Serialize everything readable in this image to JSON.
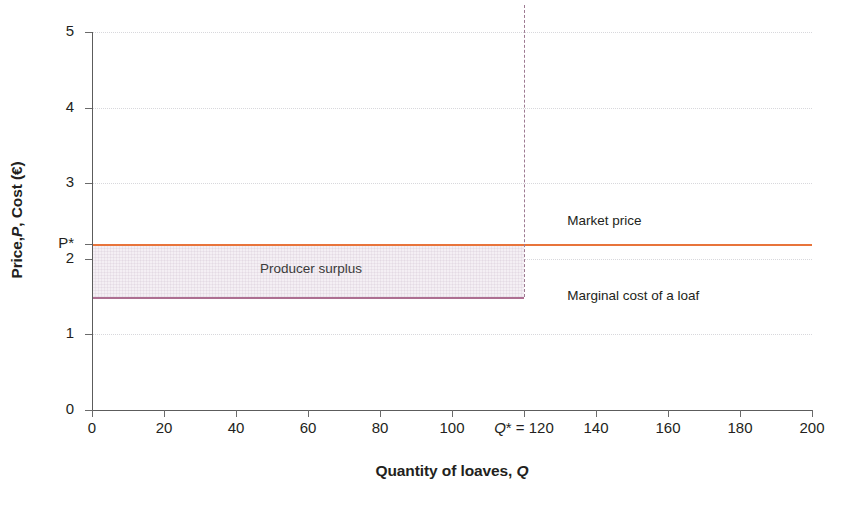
{
  "chart_data": {
    "type": "line",
    "title": "",
    "xlabel": "Quantity of loaves, Q",
    "ylabel": "Price, P, Cost (€)",
    "xlim": [
      0,
      200
    ],
    "ylim": [
      0,
      5
    ],
    "grid": true,
    "legend_position": "inline-right",
    "xticks": [
      0,
      20,
      40,
      60,
      80,
      100,
      120,
      140,
      160,
      180,
      200
    ],
    "xticklabels": [
      "0",
      "20",
      "40",
      "60",
      "80",
      "100",
      "Q* = 120",
      "140",
      "160",
      "180",
      "200"
    ],
    "yticks": [
      0,
      1,
      2,
      3,
      4,
      5
    ],
    "yticklabels": [
      "0",
      "1",
      "2",
      "3",
      "4",
      "5"
    ],
    "extra_ytick": {
      "value": 2.2,
      "label": "P*"
    },
    "series": [
      {
        "name": "Market price",
        "color": "#e8743b",
        "x": [
          0,
          200
        ],
        "values": [
          2.2,
          2.2
        ],
        "style": "solid"
      },
      {
        "name": "Marginal cost of a loaf",
        "color": "#ad6f92",
        "x": [
          0,
          120
        ],
        "values": [
          1.5,
          1.5
        ],
        "style": "solid"
      }
    ],
    "annotations": [
      {
        "name": "producer-surplus",
        "text": "Producer surplus",
        "x": 60,
        "y": 1.85,
        "region": {
          "x0": 0,
          "x1": 120,
          "y0": 1.5,
          "y1": 2.2,
          "fill": "#f4eff4"
        }
      },
      {
        "name": "equilibrium-quantity-marker",
        "text": "Q* = 120",
        "x": 120,
        "style": "dashed-vertical",
        "y_from": 1.5,
        "y_to": 5.0,
        "color": "#9e7a92"
      }
    ]
  },
  "axes": {
    "y_title_prefix": "Price, ",
    "y_title_italic": "P",
    "y_title_suffix": ", Cost (€)",
    "x_title_prefix": "Quantity of loaves, ",
    "x_title_italic": "Q"
  },
  "labels": {
    "market_price": "Market price",
    "marginal_cost": "Marginal cost of a loaf",
    "producer_surplus": "Producer surplus",
    "p_star": "P*",
    "q_star_prefix": "Q",
    "q_star_suffix": "* = 120"
  },
  "colors": {
    "market_price_line": "#e8743b",
    "marginal_cost_line": "#ad6f92",
    "surplus_fill": "#f4eff4",
    "dashed_line": "#9e7a92",
    "axis": "#5c5c5c",
    "gridline": "#d8d8dc",
    "text": "#231f20",
    "background": "#ffffff"
  }
}
